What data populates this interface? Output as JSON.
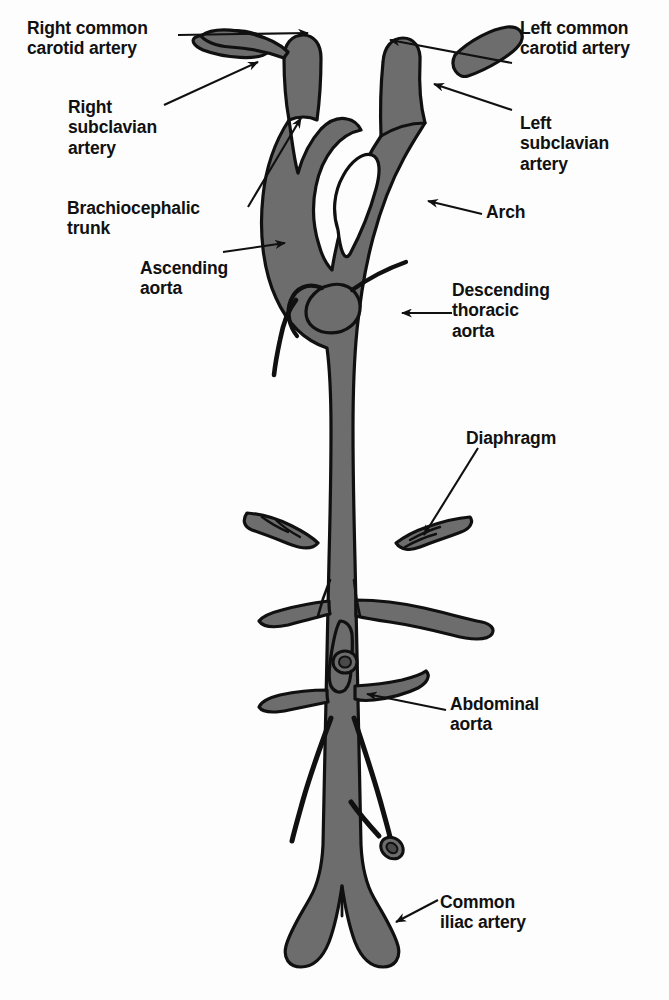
{
  "figure": {
    "fill_color": "#6d6d6d",
    "outline_color": "#101010",
    "background_color": "#fdfdfd",
    "leader_color": "#101010"
  },
  "labels": {
    "right_common_carotid": "Right common\ncarotid artery",
    "right_subclavian": "Right\nsubclavian\nartery",
    "brachiocephalic_trunk": "Brachiocephalic\ntrunk",
    "ascending_aorta": "Ascending\naorta",
    "left_common_carotid": "Left common\ncarotid artery",
    "left_subclavian": "Left\nsubclavian\nartery",
    "arch": "Arch",
    "descending_thoracic_aorta": "Descending\nthoracic\naorta",
    "diaphragm": "Diaphragm",
    "abdominal_aorta": "Abdominal\naorta",
    "common_iliac_artery": "Common\niliac artery"
  }
}
